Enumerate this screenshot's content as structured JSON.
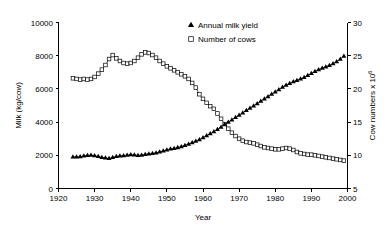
{
  "chart_data": {
    "type": "line",
    "title": "",
    "xlabel": "Year",
    "ylabel": "Milk (kg/cow)",
    "y2label": "Cow numbers x 10",
    "y2label_exponent": "6",
    "xlim": [
      1920,
      2000
    ],
    "ylim": [
      0,
      10000
    ],
    "y2lim": [
      5,
      30
    ],
    "xticks": [
      1920,
      1930,
      1940,
      1950,
      1960,
      1970,
      1980,
      1990,
      2000
    ],
    "yticks": [
      0,
      2000,
      4000,
      6000,
      8000,
      10000
    ],
    "y2ticks": [
      5,
      10,
      15,
      20,
      25,
      30
    ],
    "grid": false,
    "legend_position": "top-center",
    "legend": [
      {
        "label": "Annual milk yield",
        "marker": "filled-triangle",
        "axis": "left"
      },
      {
        "label": "Number of cows",
        "marker": "open-square",
        "axis": "right"
      }
    ],
    "x": [
      1924,
      1925,
      1926,
      1927,
      1928,
      1929,
      1930,
      1931,
      1932,
      1933,
      1934,
      1935,
      1936,
      1937,
      1938,
      1939,
      1940,
      1941,
      1942,
      1943,
      1944,
      1945,
      1946,
      1947,
      1948,
      1949,
      1950,
      1951,
      1952,
      1953,
      1954,
      1955,
      1956,
      1957,
      1958,
      1959,
      1960,
      1961,
      1962,
      1963,
      1964,
      1965,
      1966,
      1967,
      1968,
      1969,
      1970,
      1971,
      1972,
      1973,
      1974,
      1975,
      1976,
      1977,
      1978,
      1979,
      1980,
      1981,
      1982,
      1983,
      1984,
      1985,
      1986,
      1987,
      1988,
      1989,
      1990,
      1991,
      1992,
      1993,
      1994,
      1995,
      1996,
      1997,
      1998,
      1999
    ],
    "series": [
      {
        "name": "Annual milk yield",
        "unit": "kg/cow",
        "axis": "left",
        "marker": "filled-triangle",
        "values": [
          1900,
          1905,
          1915,
          1960,
          2000,
          2010,
          1975,
          1930,
          1880,
          1840,
          1810,
          1870,
          1930,
          1960,
          1985,
          2010,
          2040,
          2020,
          1990,
          2010,
          2060,
          2090,
          2110,
          2150,
          2200,
          2270,
          2330,
          2380,
          2420,
          2470,
          2530,
          2600,
          2680,
          2760,
          2850,
          2950,
          3060,
          3180,
          3300,
          3420,
          3560,
          3700,
          3860,
          4000,
          4140,
          4280,
          4420,
          4560,
          4700,
          4840,
          4980,
          5120,
          5260,
          5400,
          5540,
          5680,
          5820,
          5960,
          6100,
          6230,
          6340,
          6440,
          6520,
          6600,
          6700,
          6810,
          6930,
          7050,
          7160,
          7250,
          7330,
          7420,
          7520,
          7640,
          7790,
          7980
        ]
      },
      {
        "name": "Number of cows",
        "unit": "millions",
        "axis": "right",
        "marker": "open-square",
        "values": [
          21.6,
          21.5,
          21.4,
          21.5,
          21.4,
          21.5,
          21.8,
          22.3,
          22.9,
          23.6,
          24.5,
          25.1,
          24.6,
          24.2,
          23.9,
          23.8,
          23.9,
          24.2,
          24.7,
          25.2,
          25.5,
          25.4,
          25.1,
          24.7,
          24.2,
          23.8,
          23.4,
          23.1,
          22.8,
          22.5,
          22.2,
          21.9,
          21.5,
          20.9,
          20.2,
          19.2,
          18.5,
          17.9,
          17.4,
          17.0,
          16.3,
          15.5,
          14.7,
          14.0,
          13.4,
          12.9,
          12.5,
          12.2,
          12.0,
          11.9,
          11.8,
          11.6,
          11.4,
          11.2,
          11.1,
          11.0,
          10.9,
          10.9,
          11.0,
          11.1,
          11.0,
          10.8,
          10.5,
          10.3,
          10.2,
          10.1,
          10.1,
          10.0,
          9.9,
          9.8,
          9.7,
          9.6,
          9.5,
          9.4,
          9.3,
          9.2
        ]
      }
    ]
  }
}
